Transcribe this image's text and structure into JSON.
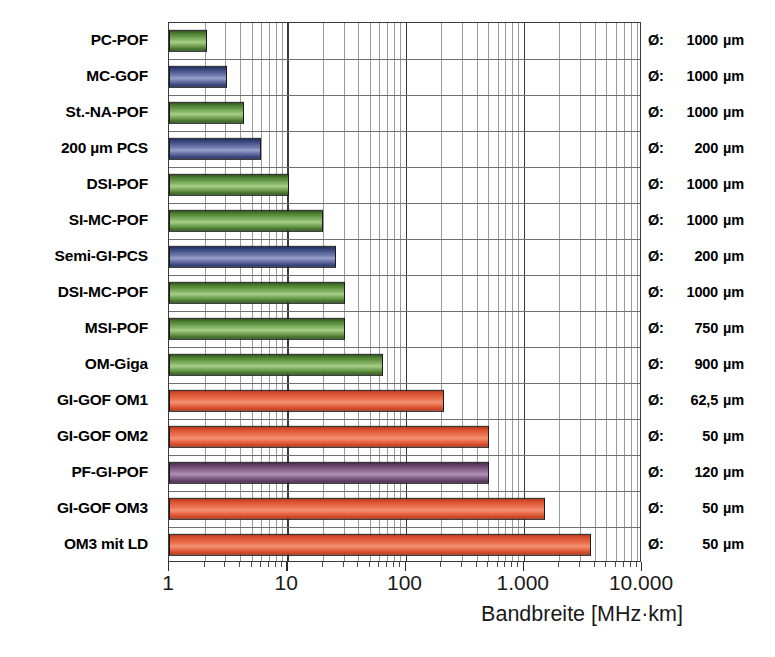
{
  "chart_data": {
    "type": "bar",
    "orientation": "horizontal",
    "title": "",
    "xlabel": "Bandbreite [MHz·km]",
    "ylabel": "",
    "xscale": "log",
    "xlim": [
      1,
      10000
    ],
    "xticks": [
      1,
      10,
      100,
      1000,
      10000
    ],
    "xtick_labels": [
      "1",
      "10",
      "100",
      "1.000",
      "10.000"
    ],
    "grid": true,
    "legend": "none",
    "categories": [
      "PC-POF",
      "MC-GOF",
      "St.-NA-POF",
      "200 µm PCS",
      "DSI-POF",
      "SI-MC-POF",
      "Semi-GI-PCS",
      "DSI-MC-POF",
      "MSI-POF",
      "OM-Giga",
      "GI-GOF OM1",
      "GI-GOF OM2",
      "PF-GI-POF",
      "GI-GOF OM3",
      "OM3 mit LD"
    ],
    "values": [
      2.1,
      3.1,
      4.3,
      6.0,
      10.3,
      20,
      26,
      31,
      31,
      65,
      210,
      510,
      510,
      1500,
      3700
    ],
    "bar_colors": [
      "green",
      "blue",
      "green",
      "blue",
      "green",
      "green",
      "blue",
      "green",
      "green",
      "green",
      "orange",
      "orange",
      "purple",
      "orange",
      "orange"
    ],
    "annotations": [
      {
        "key": "Ø:",
        "value": "1000",
        "unit": "µm"
      },
      {
        "key": "Ø:",
        "value": "1000",
        "unit": "µm"
      },
      {
        "key": "Ø:",
        "value": "1000",
        "unit": "µm"
      },
      {
        "key": "Ø:",
        "value": "200",
        "unit": "µm"
      },
      {
        "key": "Ø:",
        "value": "1000",
        "unit": "µm"
      },
      {
        "key": "Ø:",
        "value": "1000",
        "unit": "µm"
      },
      {
        "key": "Ø:",
        "value": "200",
        "unit": "µm"
      },
      {
        "key": "Ø:",
        "value": "1000",
        "unit": "µm"
      },
      {
        "key": "Ø:",
        "value": "750",
        "unit": "µm"
      },
      {
        "key": "Ø:",
        "value": "900",
        "unit": "µm"
      },
      {
        "key": "Ø:",
        "value": "62,5",
        "unit": "µm"
      },
      {
        "key": "Ø:",
        "value": "50",
        "unit": "µm"
      },
      {
        "key": "Ø:",
        "value": "120",
        "unit": "µm"
      },
      {
        "key": "Ø:",
        "value": "50",
        "unit": "µm"
      },
      {
        "key": "Ø:",
        "value": "50",
        "unit": "µm"
      }
    ]
  },
  "colors": {
    "green": "#4e7f32",
    "blue": "#39477e",
    "orange": "#e4613e",
    "purple": "#7d5a82",
    "grid_minor": "#9a9a9a",
    "grid_major": "#3a3a3a",
    "text": "#000000"
  }
}
